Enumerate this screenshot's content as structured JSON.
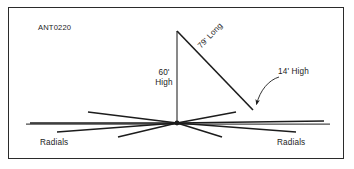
{
  "diagram": {
    "drawing_id": "ANT0220",
    "labels": {
      "mast_height": "60'\nHigh",
      "mast_height_line1": "60'",
      "mast_height_line2": "High",
      "wire_length": "79' Long",
      "end_height": "14' High",
      "radials_left": "Radials",
      "radials_right": "Radials"
    },
    "colors": {
      "background": "#ffffff",
      "border": "#2b2b2b",
      "line": "#1c1c1c",
      "text": "#1c1c1c",
      "ground": "#4a4a4a"
    },
    "geometry": {
      "mast_top": [
        177,
        31
      ],
      "hub": [
        177,
        123
      ],
      "wire_end": [
        253,
        110
      ],
      "ground_y": 124,
      "ground_x_start": 26,
      "ground_x_end": 330,
      "radials": [
        [
          88,
          112
        ],
        [
          57,
          132
        ],
        [
          118,
          137
        ],
        [
          30,
          124
        ],
        [
          236,
          112
        ],
        [
          296,
          132
        ],
        [
          222,
          137
        ],
        [
          324,
          122
        ]
      ],
      "arrow_leader_start": [
        276,
        78
      ],
      "arrow_leader_end": [
        256,
        106
      ]
    }
  }
}
